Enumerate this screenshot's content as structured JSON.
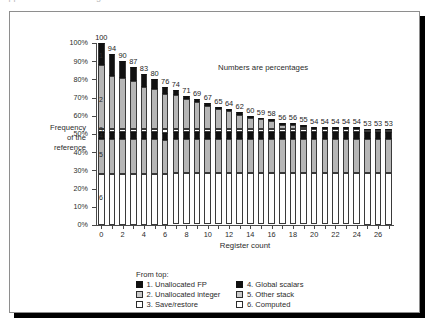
{
  "ghost_text": "clipped text line above figure",
  "figure": {
    "annotation": "Numbers are percentages",
    "ylabel_lines": [
      "Frequency",
      "of the",
      "reference"
    ],
    "xlabel": "Register count"
  },
  "legend": {
    "title": "From top:",
    "columns": [
      [
        {
          "swatch": "black",
          "label": "1. Unallocated FP"
        },
        {
          "swatch": "gray",
          "label": "2. Unallocated integer"
        },
        {
          "swatch": "white",
          "label": "3. Save/restore"
        }
      ],
      [
        {
          "swatch": "black",
          "label": "4. Global scalars"
        },
        {
          "swatch": "gray",
          "label": "5. Other stack"
        },
        {
          "swatch": "white",
          "label": "6. Computed"
        }
      ]
    ]
  },
  "segment_markers": [
    {
      "id": "1",
      "y_pct": 93
    },
    {
      "id": "2",
      "y_pct": 69
    },
    {
      "id": "3",
      "y_pct": 52.5
    },
    {
      "id": "4",
      "y_pct": 49
    },
    {
      "id": "5",
      "y_pct": 39
    },
    {
      "id": "6",
      "y_pct": 15
    }
  ],
  "chart_data": {
    "type": "bar",
    "subtype": "stacked-bar",
    "title": "",
    "annotation": "Numbers are percentages",
    "xlabel": "Register count",
    "ylabel": "Frequency of the reference",
    "ylim": [
      0,
      100
    ],
    "yticks": [
      0,
      10,
      20,
      30,
      40,
      50,
      60,
      70,
      80,
      90,
      100
    ],
    "ytick_labels": [
      "0%",
      "10%",
      "20%",
      "30%",
      "40%",
      "50%",
      "60%",
      "70%",
      "80%",
      "90%",
      "100%"
    ],
    "grid": false,
    "legend_position": "below",
    "x": [
      0,
      1,
      2,
      3,
      4,
      5,
      6,
      7,
      8,
      9,
      10,
      11,
      12,
      13,
      14,
      15,
      16,
      17,
      18,
      19,
      20,
      21,
      22,
      23,
      24,
      25,
      26,
      27
    ],
    "xtick_labels": [
      "0",
      "2",
      "4",
      "6",
      "8",
      "10",
      "12",
      "14",
      "16",
      "18",
      "20",
      "22",
      "24",
      "26"
    ],
    "xticks": [
      0,
      2,
      4,
      6,
      8,
      10,
      12,
      14,
      16,
      18,
      20,
      22,
      24,
      26
    ],
    "bar_totals": [
      100,
      94,
      90,
      87,
      83,
      80,
      76,
      74,
      71,
      69,
      67,
      65,
      64,
      62,
      60,
      59,
      58,
      56,
      56,
      55,
      54,
      54,
      54,
      54,
      54,
      53,
      53,
      53
    ],
    "series": [
      {
        "name": "1. Unallocated FP",
        "swatch": "black",
        "values": [
          12,
          12,
          9.5,
          8,
          7,
          5,
          4,
          2.5,
          1.5,
          1.5,
          1.5,
          1.5,
          1.5,
          1.5,
          1,
          1,
          1,
          1,
          1,
          1,
          1,
          1,
          1,
          1,
          1,
          1,
          1,
          1
        ]
      },
      {
        "name": "2. Unallocated integer",
        "swatch": "gray",
        "values": [
          35,
          29,
          27.5,
          26,
          23,
          22,
          19.5,
          18.5,
          16.5,
          14.5,
          12.5,
          10.5,
          9.5,
          7.5,
          6,
          5,
          4,
          2,
          2,
          1,
          0.5,
          0.5,
          0.5,
          0.5,
          0.5,
          0,
          0,
          0
        ]
      },
      {
        "name": "3. Save/restore",
        "swatch": "white",
        "values": [
          2,
          2,
          2,
          2,
          2,
          2,
          2,
          2,
          2,
          2,
          2,
          2,
          2,
          2,
          2,
          2,
          2,
          2,
          2,
          2,
          1.5,
          1.5,
          1.5,
          1.5,
          1.5,
          1,
          1,
          1
        ]
      },
      {
        "name": "4. Global scalars",
        "swatch": "black",
        "values": [
          4,
          4,
          4,
          4,
          4,
          4,
          4,
          4,
          4,
          4,
          4,
          4,
          4,
          4,
          4,
          4,
          4,
          4,
          4,
          4,
          4,
          4,
          4,
          4,
          4,
          4,
          4,
          4
        ]
      },
      {
        "name": "5. Other stack",
        "swatch": "gray",
        "values": [
          19,
          19,
          19,
          19,
          19,
          19,
          18.5,
          18.5,
          18.5,
          18.5,
          18.5,
          18.5,
          18.5,
          18.5,
          18.5,
          18.5,
          18.5,
          18.5,
          18.5,
          18.5,
          18.5,
          18.5,
          18.5,
          18.5,
          18.5,
          18.5,
          18.5,
          18.5
        ]
      },
      {
        "name": "6. Computed",
        "swatch": "white",
        "values": [
          28,
          28,
          28,
          28,
          28,
          28,
          28,
          28,
          28,
          28,
          28,
          28,
          28,
          28,
          28,
          28,
          28,
          28,
          28,
          28,
          28,
          28,
          28,
          28,
          28,
          28.5,
          28.5,
          28.5
        ]
      }
    ]
  }
}
